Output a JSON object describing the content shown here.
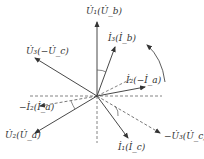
{
  "diagram": {
    "type": "phasor-diagram",
    "center": [
      97,
      96
    ],
    "colors": {
      "line": "#444444",
      "dashed": "#666666",
      "background": "#ffffff"
    },
    "labels": {
      "U1": "U̇₁(U̇_b)",
      "I3": "İ₃(İ_b)",
      "U3": "U̇₃(−U̇_c)",
      "I2": "İ₂(−İ_a)",
      "negI2": "−İ₂(İ_a)",
      "U2": "U̇₂(U̇_a)",
      "I1": "İ₁(İ_c)",
      "negU3": "−U̇₃(U̇_c)"
    },
    "phasors": [
      {
        "name": "U1",
        "end": [
          97,
          22
        ],
        "style": "solid"
      },
      {
        "name": "I3",
        "end": [
          115,
          47
        ],
        "style": "solid"
      },
      {
        "name": "U3",
        "end": [
          35,
          58
        ],
        "style": "solid"
      },
      {
        "name": "I2",
        "end": [
          145,
          87
        ],
        "style": "solid"
      },
      {
        "name": "negI2",
        "end": [
          40,
          106
        ],
        "style": "dashed"
      },
      {
        "name": "U2",
        "end": [
          35,
          133
        ],
        "style": "solid"
      },
      {
        "name": "I1",
        "end": [
          128,
          138
        ],
        "style": "solid"
      },
      {
        "name": "negU3",
        "end": [
          160,
          133
        ],
        "style": "dashed"
      }
    ],
    "rotation_direction": "counter-clockwise"
  }
}
